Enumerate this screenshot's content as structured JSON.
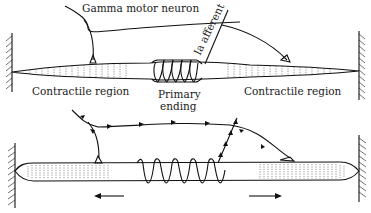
{
  "figure": {
    "panels": [
      {
        "id": "top",
        "labels": {
          "gamma_motor_neuron": "Gamma motor neuron",
          "ia_afferent": "Ia afferent",
          "contractile_left": "Contractile region",
          "contractile_right": "Contractile region",
          "primary_ending_line1": "Primary",
          "primary_ending_line2": "ending"
        }
      },
      {
        "id": "bottom",
        "description": "Gamma activation contracts polar regions (arrows point outward), stretching primary ending; impulses travel along efferent and afferent fibers"
      }
    ],
    "colors": {
      "ink": "#111111",
      "background": "#ffffff"
    }
  }
}
